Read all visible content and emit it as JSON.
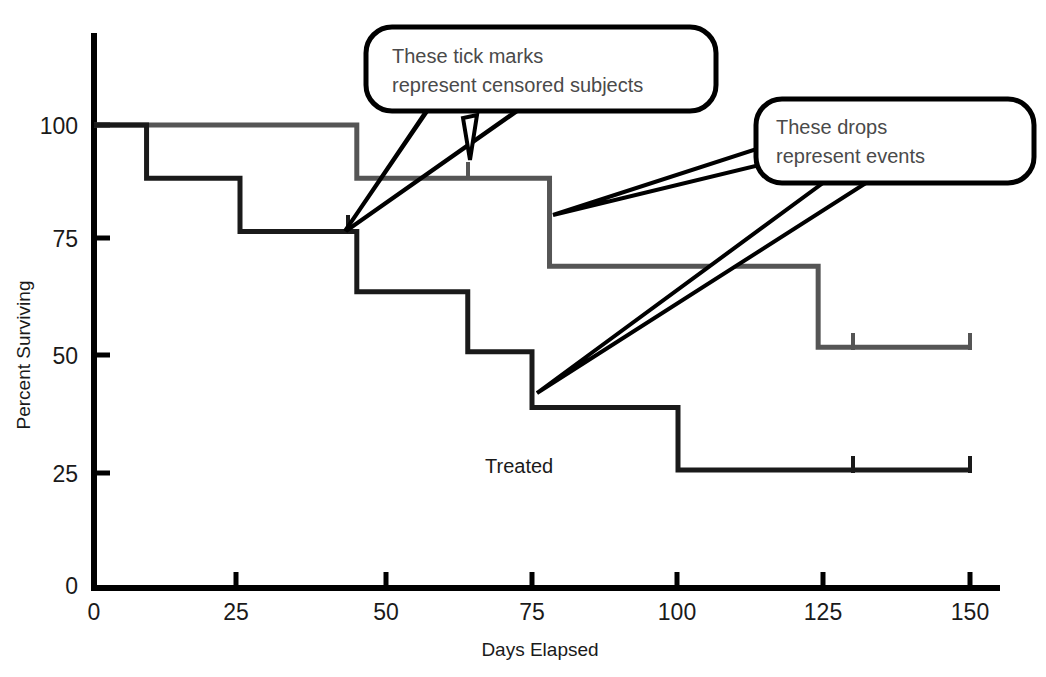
{
  "chart_data": {
    "type": "line",
    "subtype": "kaplan-meier-step",
    "title": "",
    "xlabel": "Days Elapsed",
    "ylabel": "Percent Surviving",
    "xlim": [
      0,
      161
    ],
    "ylim": [
      0,
      112
    ],
    "xticks": [
      0,
      25,
      50,
      75,
      100,
      125,
      150
    ],
    "xtick_labels": [
      "0",
      "25",
      "50",
      "75",
      "100",
      "125",
      "150"
    ],
    "yticks": [
      0,
      25,
      50,
      75,
      100
    ],
    "ytick_labels": [
      "0",
      "25",
      "50",
      "75",
      "100"
    ],
    "grid": false,
    "legend": "none",
    "series": [
      {
        "name": "Control",
        "color": "#555555",
        "line_width": 3,
        "steps": [
          {
            "x": 0,
            "y": 100
          },
          {
            "x": 45,
            "y": 100
          },
          {
            "x": 45,
            "y": 88.5
          },
          {
            "x": 78,
            "y": 88.5
          },
          {
            "x": 78,
            "y": 69.5
          },
          {
            "x": 124,
            "y": 69.5
          },
          {
            "x": 124,
            "y": 52
          },
          {
            "x": 150,
            "y": 52
          }
        ],
        "censored_marks": [
          {
            "x": 64,
            "y": 88.5
          },
          {
            "x": 130,
            "y": 52
          },
          {
            "x": 150,
            "y": 52
          }
        ],
        "events": [
          {
            "x": 45,
            "from": 100,
            "to": 88.5
          },
          {
            "x": 78,
            "from": 88.5,
            "to": 69.5
          },
          {
            "x": 124,
            "from": 69.5,
            "to": 52
          }
        ]
      },
      {
        "name": "Treated",
        "color": "#1a1a1a",
        "line_width": 3,
        "steps": [
          {
            "x": 0,
            "y": 100
          },
          {
            "x": 9,
            "y": 100
          },
          {
            "x": 9,
            "y": 88.5
          },
          {
            "x": 25,
            "y": 88.5
          },
          {
            "x": 25,
            "y": 77
          },
          {
            "x": 45,
            "y": 77
          },
          {
            "x": 45,
            "y": 64
          },
          {
            "x": 64,
            "y": 64
          },
          {
            "x": 64,
            "y": 51
          },
          {
            "x": 75,
            "y": 51
          },
          {
            "x": 75,
            "y": 39
          },
          {
            "x": 100,
            "y": 39
          },
          {
            "x": 100,
            "y": 25.5
          },
          {
            "x": 150,
            "y": 25.5
          }
        ],
        "censored_marks": [
          {
            "x": 43,
            "y": 77
          },
          {
            "x": 130,
            "y": 25.5
          },
          {
            "x": 150,
            "y": 25.5
          }
        ],
        "events": [
          {
            "x": 9,
            "from": 100,
            "to": 88.5
          },
          {
            "x": 25,
            "from": 88.5,
            "to": 77
          },
          {
            "x": 45,
            "from": 77,
            "to": 64
          },
          {
            "x": 64,
            "from": 64,
            "to": 51
          },
          {
            "x": 75,
            "from": 51,
            "to": 39
          },
          {
            "x": 100,
            "from": 39,
            "to": 25.5
          }
        ]
      }
    ],
    "series_labels": [
      {
        "text": "Treated",
        "x": 72,
        "y": 32
      }
    ],
    "annotations": [
      {
        "id": "censored-callout",
        "line1": "These tick marks",
        "line2": "represent censored subjects",
        "points_to": [
          "Treated curve tick at day 43",
          "Control curve tick at day 64"
        ]
      },
      {
        "id": "events-callout",
        "line1": "These drops",
        "line2": "represent events",
        "points_to": [
          "Control curve drop at day 78",
          "Treated curve drop at day 75"
        ]
      }
    ]
  },
  "axis": {
    "y_title": "Percent Surviving",
    "x_title": "Days Elapsed",
    "x_labels": [
      "0",
      "25",
      "50",
      "75",
      "100",
      "125",
      "150"
    ],
    "y_labels": [
      "100",
      "75",
      "50",
      "25",
      "0"
    ]
  },
  "labels": {
    "treated": "Treated"
  },
  "callouts": {
    "censored": {
      "line1": "These tick marks",
      "line2": "represent censored subjects"
    },
    "events": {
      "line1": "These drops",
      "line2": "represent events"
    }
  },
  "colors": {
    "control_curve": "#555555",
    "treated_curve": "#1a1a1a",
    "axis": "#000000",
    "callout_text": "#4a4a4a",
    "callout_border": "#000000",
    "background": "#ffffff"
  }
}
